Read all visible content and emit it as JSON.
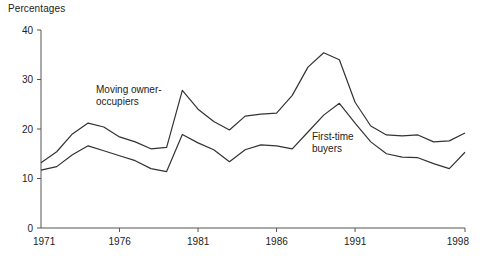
{
  "chart_data": {
    "type": "line",
    "title": "",
    "subtitle": "",
    "ylabel": "Percentages",
    "xlabel": "",
    "ylim": [
      0,
      40
    ],
    "xlim": [
      1971,
      1998
    ],
    "yticks": [
      0,
      10,
      20,
      30,
      40
    ],
    "ytick_labels": [
      "0",
      "10",
      "20",
      "30",
      "40"
    ],
    "xticks": [
      1971,
      1976,
      1981,
      1986,
      1991,
      1998
    ],
    "xtick_labels": [
      "1971",
      "1976",
      "1981",
      "1986",
      "1991",
      "1998"
    ],
    "grid": false,
    "legend_position": "inline-annotations",
    "x": [
      1971,
      1972,
      1973,
      1974,
      1975,
      1976,
      1977,
      1978,
      1979,
      1980,
      1981,
      1982,
      1983,
      1984,
      1985,
      1986,
      1987,
      1988,
      1989,
      1990,
      1991,
      1992,
      1993,
      1994,
      1995,
      1996,
      1997,
      1998
    ],
    "series": [
      {
        "name": "Moving owner-occupiers",
        "label": "Moving owner-\noccupiers",
        "color": "#333333",
        "values": [
          13.2,
          15.4,
          19.0,
          21.2,
          20.4,
          18.4,
          17.4,
          16.0,
          16.3,
          27.8,
          24.0,
          21.5,
          19.8,
          22.6,
          23.0,
          23.2,
          26.8,
          32.5,
          35.4,
          34.0,
          25.4,
          20.6,
          18.8,
          18.6,
          18.8,
          17.4,
          17.6,
          19.2
        ]
      },
      {
        "name": "First-time buyers",
        "label": "First-time\nbuyers",
        "color": "#333333",
        "values": [
          11.7,
          12.4,
          14.8,
          16.6,
          15.6,
          14.6,
          13.6,
          12.0,
          11.4,
          18.9,
          17.2,
          15.8,
          13.4,
          15.8,
          16.8,
          16.6,
          16.0,
          19.4,
          22.8,
          25.2,
          21.2,
          17.4,
          15.0,
          14.3,
          14.2,
          13.0,
          12.0,
          15.3
        ]
      }
    ]
  },
  "axes": {
    "y_axis_title": "Percentages"
  }
}
